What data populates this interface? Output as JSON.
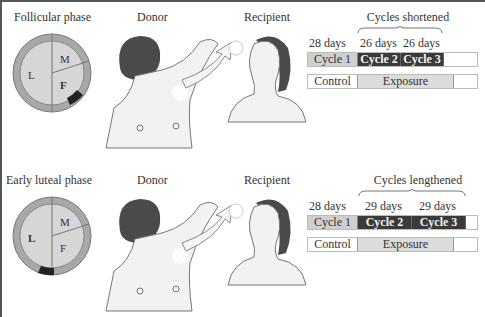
{
  "panels": [
    {
      "phase_label": "Follicular phase",
      "donor_label": "Donor",
      "recipient_label": "Recipient",
      "circle": {
        "labels": [
          "M",
          "L",
          "F"
        ],
        "marker_position": "follicular"
      },
      "group_label": "Cycles shortened",
      "days": [
        "28 days",
        "26 days",
        "26 days"
      ],
      "cycles": [
        "Cycle 1",
        "Cycle 2",
        "Cycle 3"
      ],
      "condition": {
        "control": "Control",
        "exposure": "Exposure"
      }
    },
    {
      "phase_label": "Early luteal phase",
      "donor_label": "Donor",
      "recipient_label": "Recipient",
      "circle": {
        "labels": [
          "M",
          "L",
          "F"
        ],
        "marker_position": "early-luteal"
      },
      "group_label": "Cycles lengthened",
      "days": [
        "28 days",
        "29 days",
        "29 days"
      ],
      "cycles": [
        "Cycle 1",
        "Cycle 2",
        "Cycle 3"
      ],
      "condition": {
        "control": "Control",
        "exposure": "Exposure"
      }
    }
  ],
  "colors": {
    "control_cycle": "#cfcfcf",
    "exposed_cycle": "#3a3a3a",
    "exposure_bar": "#dcdcdc",
    "ring": "#a8a8a8",
    "disc": "#d6d6d6"
  }
}
